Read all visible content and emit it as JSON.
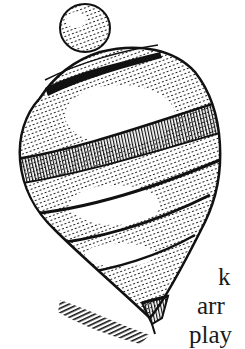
{
  "image": {
    "subject": "engraved illustration of a spinning top",
    "ink_color": "#111111",
    "paper_color": "#ffffff"
  },
  "text_fragment": {
    "lines": [
      "k",
      "arr",
      "play"
    ]
  }
}
